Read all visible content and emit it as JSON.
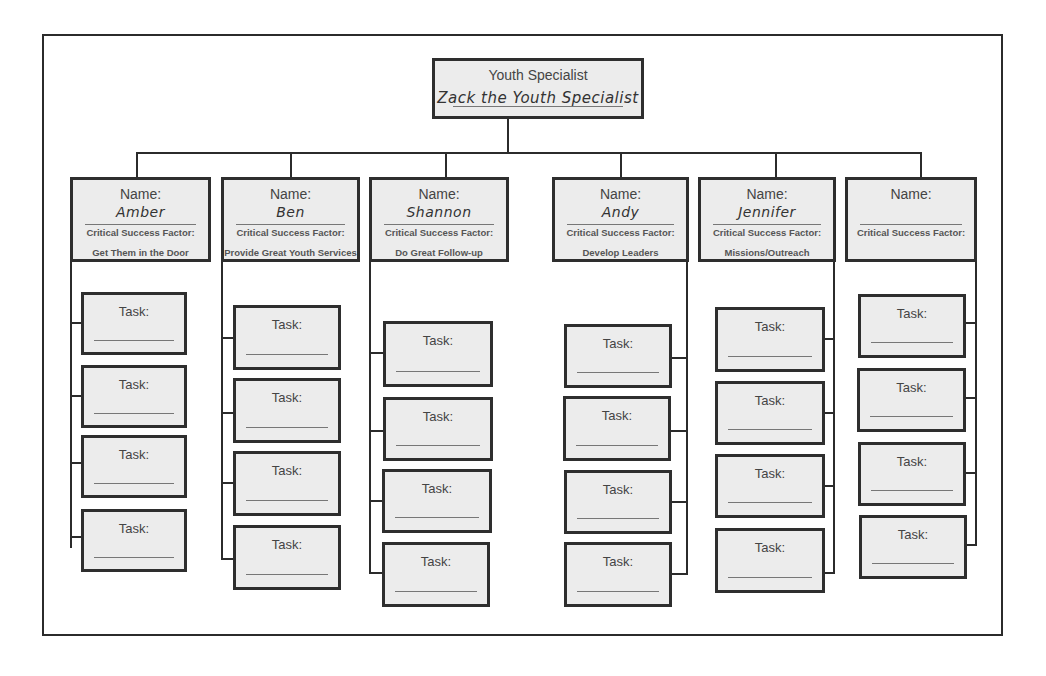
{
  "top": {
    "role": "Youth Specialist",
    "name": "Zack the Youth Specialist"
  },
  "labels": {
    "name": "Name:",
    "csf": "Critical Success Factor:",
    "task": "Task:"
  },
  "columns": [
    {
      "name": "Amber",
      "csf": "Get Them in the Door",
      "side": "left"
    },
    {
      "name": "Ben",
      "csf": "Provide Great Youth Services",
      "side": "left"
    },
    {
      "name": "Shannon",
      "csf": "Do Great Follow-up",
      "side": "left"
    },
    {
      "name": "Andy",
      "csf": "Develop Leaders",
      "side": "right"
    },
    {
      "name": "Jennifer",
      "csf": "Missions/Outreach",
      "side": "right"
    },
    {
      "name": "",
      "csf": "",
      "side": "right"
    }
  ],
  "colors": {
    "line": "#2b2b2b",
    "box_fill": "#ececec",
    "border": "#2e2e2e"
  }
}
